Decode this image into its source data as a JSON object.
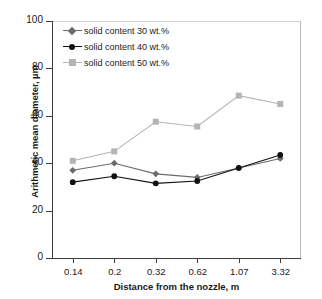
{
  "chart_data": {
    "type": "line",
    "title": "",
    "xlabel": "Distance from the nozzle, m",
    "ylabel": "Arithmetic mean diameter, µm",
    "categories": [
      "0.14",
      "0.2",
      "0.32",
      "0.62",
      "1.07",
      "3.32"
    ],
    "yticks": [
      "0",
      "20",
      "40",
      "60",
      "80",
      "100"
    ],
    "ylim": [
      0,
      100
    ],
    "grid": false,
    "legend_position": "top-left",
    "series": [
      {
        "name": "solid content 30 wt.%",
        "marker": "diamond",
        "color": "#6b6b6b",
        "values": [
          37,
          40,
          35.5,
          34,
          38,
          42
        ]
      },
      {
        "name": "solid content 40 wt.%",
        "marker": "circle",
        "color": "#111111",
        "values": [
          32,
          34.5,
          31.5,
          32.5,
          38,
          43.5
        ]
      },
      {
        "name": "solid content 50 wt.%",
        "marker": "square",
        "color": "#b4b4b4",
        "values": [
          41,
          45,
          57.5,
          55.5,
          68.5,
          65
        ]
      }
    ]
  }
}
